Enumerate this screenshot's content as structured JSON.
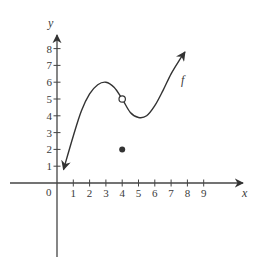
{
  "chart_data": {
    "type": "line",
    "title": "",
    "xlabel": "x",
    "ylabel": "y",
    "curve_label": "f",
    "origin_label": "0",
    "x_ticks": [
      "1",
      "2",
      "3",
      "4",
      "5",
      "6",
      "7",
      "8",
      "9"
    ],
    "y_ticks": [
      "1",
      "2",
      "3",
      "4",
      "5",
      "6",
      "7",
      "8"
    ],
    "xlim": [
      -2.5,
      11.5
    ],
    "ylim": [
      -4.8,
      8.8
    ],
    "grid": false,
    "series": [
      {
        "name": "f",
        "points": [
          [
            0.4,
            0.8
          ],
          [
            1.0,
            2.8
          ],
          [
            1.5,
            4.3
          ],
          [
            2.0,
            5.3
          ],
          [
            2.5,
            5.85
          ],
          [
            3.0,
            6.0
          ],
          [
            3.5,
            5.7
          ],
          [
            4.0,
            5.0
          ],
          [
            4.5,
            4.2
          ],
          [
            5.0,
            3.9
          ],
          [
            5.5,
            4.0
          ],
          [
            6.0,
            4.6
          ],
          [
            6.5,
            5.5
          ],
          [
            7.0,
            6.5
          ],
          [
            7.5,
            7.3
          ],
          [
            7.85,
            7.8
          ]
        ],
        "arrow_start": true,
        "arrow_end": true
      }
    ],
    "open_points": [
      [
        4,
        5
      ]
    ],
    "closed_points": [
      [
        4,
        2
      ]
    ],
    "annotations": [
      {
        "text": "f",
        "x": 7.8,
        "y": 6.1
      }
    ]
  },
  "colors": {
    "ink": "#333333",
    "axis": "#444444"
  }
}
